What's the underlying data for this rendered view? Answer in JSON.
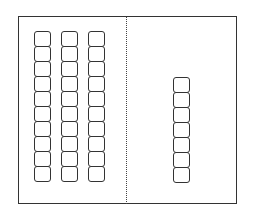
{
  "diagram": {
    "type": "base-ten-blocks",
    "tens": {
      "rods": 3,
      "cubes_per_rod": 10
    },
    "ones": {
      "cubes": 7
    },
    "value": 37
  }
}
